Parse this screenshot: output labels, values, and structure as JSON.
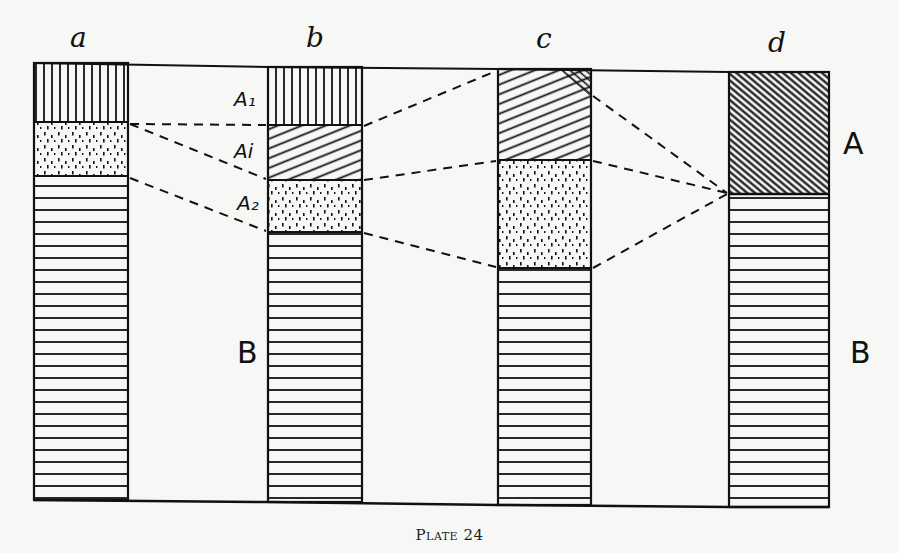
{
  "figure": {
    "caption": "Plate 24",
    "columns": [
      {
        "id": "a",
        "label": "a"
      },
      {
        "id": "b",
        "label": "b"
      },
      {
        "id": "c",
        "label": "c"
      },
      {
        "id": "d",
        "label": "d"
      }
    ],
    "horizon_labels": {
      "b_A1": "A₁",
      "b_Ai": "Ai",
      "b_A2": "A₂"
    },
    "side_labels": {
      "A_right": "A",
      "B_left": "B",
      "B_right": "B"
    },
    "legend_patterns": {
      "A1": "vertical-lines",
      "Ai": "diagonal-hatch",
      "A2": "stipple-dots",
      "A": "dense-diagonal-hatch",
      "B": "horizontal-lines"
    },
    "colors": {
      "ink": "#111111",
      "paper": "#f7f7f5"
    }
  }
}
